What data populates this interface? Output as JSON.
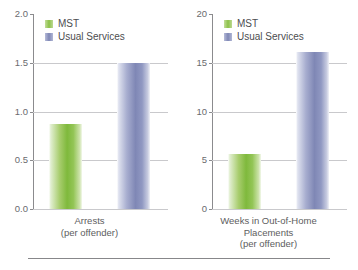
{
  "chart_data": [
    {
      "type": "bar",
      "title": "",
      "xlabel": "Arrests (per offender)",
      "ylabel": "",
      "categories": [
        "Arrests (per offender)"
      ],
      "series": [
        {
          "name": "MST",
          "values": [
            0.87
          ],
          "color": "#8cc149"
        },
        {
          "name": "Usual Services",
          "values": [
            1.5
          ],
          "color": "#7f87b5"
        }
      ],
      "ylim": [
        0.0,
        2.0
      ],
      "yticks": [
        "0.0",
        "0.5",
        "1.0",
        "1.5",
        "2.0"
      ],
      "ytick_values": [
        0.0,
        0.5,
        1.0,
        1.5,
        2.0
      ],
      "grid": true,
      "legend_position": "top-left",
      "caption_lines": [
        "Arrests",
        "(per offender)"
      ]
    },
    {
      "type": "bar",
      "title": "",
      "xlabel": "Weeks in Out-of-Home Placements (per offender)",
      "ylabel": "",
      "categories": [
        "Weeks in Out-of-Home Placements (per offender)"
      ],
      "series": [
        {
          "name": "MST",
          "values": [
            5.6
          ],
          "color": "#8cc149"
        },
        {
          "name": "Usual Services",
          "values": [
            16.1
          ],
          "color": "#7f87b5"
        }
      ],
      "ylim": [
        0,
        20
      ],
      "yticks": [
        "0",
        "5",
        "10",
        "15",
        "20"
      ],
      "ytick_values": [
        0,
        5,
        10,
        15,
        20
      ],
      "grid": true,
      "legend_position": "top-left",
      "caption_lines": [
        "Weeks in Out-of-Home",
        "Placements",
        "(per offender)"
      ]
    }
  ],
  "legend": {
    "mst_label": "MST",
    "usual_label": "Usual Services"
  },
  "colors": {
    "mst": "#8cc149",
    "usual_services": "#7f87b5",
    "axis": "#8b8b8e",
    "grid": "#c9c9cc",
    "text": "#5d5d60"
  }
}
